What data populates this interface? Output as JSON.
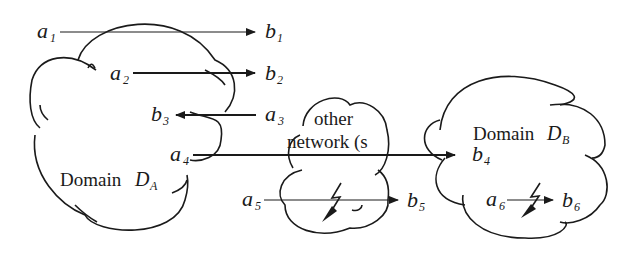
{
  "diagram": {
    "domains": [
      {
        "id": "DA",
        "prefix": "Domain ",
        "symbol": "D",
        "subscript": "A"
      },
      {
        "id": "other",
        "line1": "other",
        "line2": "network (s"
      },
      {
        "id": "DB",
        "prefix": "Domain ",
        "symbol": "D",
        "subscript": "B"
      }
    ],
    "nodes": {
      "a1": {
        "base": "a",
        "sub": "1"
      },
      "b1": {
        "base": "b",
        "sub": "1"
      },
      "a2": {
        "base": "a",
        "sub": "2"
      },
      "b2": {
        "base": "b",
        "sub": "2"
      },
      "a3": {
        "base": "a",
        "sub": "3"
      },
      "b3": {
        "base": "b",
        "sub": "3"
      },
      "a4": {
        "base": "a",
        "sub": "4"
      },
      "b4": {
        "base": "b",
        "sub": "4"
      },
      "a5": {
        "base": "a",
        "sub": "5"
      },
      "b5": {
        "base": "b",
        "sub": "5"
      },
      "a6": {
        "base": "a",
        "sub": "6"
      },
      "b6": {
        "base": "b",
        "sub": "6"
      }
    },
    "flows": [
      {
        "from": "a1",
        "to": "b1",
        "style": "thin"
      },
      {
        "from": "a2",
        "to": "b2",
        "style": "thick"
      },
      {
        "from": "a3",
        "to": "b3",
        "style": "thick"
      },
      {
        "from": "a4",
        "to": "b4",
        "style": "thick"
      },
      {
        "from": "a5",
        "to": "b5",
        "style": "thin"
      },
      {
        "from": "a6",
        "to": "b6",
        "style": "thin"
      }
    ],
    "icons": [
      "lightning-bolt-icon",
      "lightning-bolt-icon"
    ]
  }
}
